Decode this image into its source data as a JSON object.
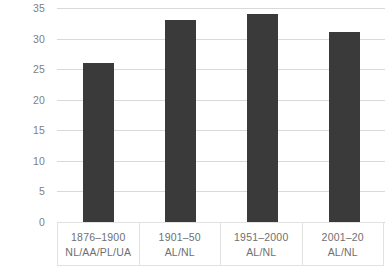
{
  "chart_data": {
    "type": "bar",
    "title": "",
    "xlabel": "",
    "ylabel": "",
    "categories": [
      "1876–1900",
      "1901–50",
      "1951–2000",
      "2001–20"
    ],
    "category_sublabels": [
      "NL/AA/PL/UA",
      "AL/NL",
      "AL/NL",
      "AL/NL"
    ],
    "values": [
      26,
      33,
      34,
      31
    ],
    "ylim": [
      0,
      35
    ],
    "yticks": [
      0,
      5,
      10,
      15,
      20,
      25,
      30,
      35
    ],
    "ytick_labels": [
      "0",
      "5",
      "10",
      "15",
      "20",
      "25",
      "30",
      "35"
    ],
    "grid": true,
    "legend": null,
    "bar_color": "#3a3a3a",
    "gridline_color": "#d9d9d9",
    "tick_label_color": "#7f7f7f"
  }
}
